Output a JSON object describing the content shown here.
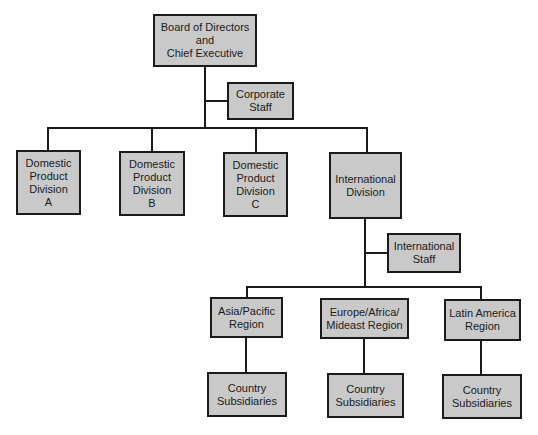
{
  "colors": {
    "box_fill": "#c9c9c9",
    "line": "#1a1a1a",
    "background": "#ffffff"
  },
  "nodes": {
    "board": {
      "label": "Board of Directors\nand\nChief Executive"
    },
    "corporate_staff": {
      "label": "Corporate\nStaff"
    },
    "div_a": {
      "label": "Domestic\nProduct\nDivision\nA"
    },
    "div_b": {
      "label": "Domestic\nProduct\nDivision\nB"
    },
    "div_c": {
      "label": "Domestic\nProduct\nDivision\nC"
    },
    "intl_div": {
      "label": "International\nDivision"
    },
    "intl_staff": {
      "label": "International\nStaff"
    },
    "asia": {
      "label": "Asia/Pacific\nRegion"
    },
    "europe": {
      "label": "Europe/Africa/\nMideast Region"
    },
    "latam": {
      "label": "Latin America\nRegion"
    },
    "sub_asia": {
      "label": "Country\nSubsidiaries"
    },
    "sub_europe": {
      "label": "Country\nSubsidiaries"
    },
    "sub_latam": {
      "label": "Country\nSubsidiaries"
    }
  },
  "edges": [
    [
      "board",
      "corporate_staff"
    ],
    [
      "board",
      "div_a"
    ],
    [
      "board",
      "div_b"
    ],
    [
      "board",
      "div_c"
    ],
    [
      "board",
      "intl_div"
    ],
    [
      "intl_div",
      "intl_staff"
    ],
    [
      "intl_div",
      "asia"
    ],
    [
      "intl_div",
      "europe"
    ],
    [
      "intl_div",
      "latam"
    ],
    [
      "asia",
      "sub_asia"
    ],
    [
      "europe",
      "sub_europe"
    ],
    [
      "latam",
      "sub_latam"
    ]
  ]
}
